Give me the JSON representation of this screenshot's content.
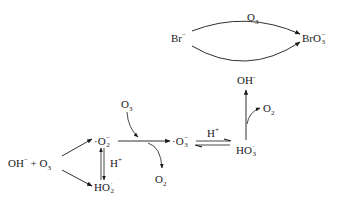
{
  "diagram": {
    "type": "reaction-scheme",
    "nodes": {
      "bromide": {
        "base": "Br",
        "sup": "−"
      },
      "bromate": {
        "base": "BrO",
        "sub": "3",
        "sup": "−"
      },
      "hydroxide_top": {
        "base": "OH",
        "sup": "-"
      },
      "hydroxide_ozone": {
        "base": "OH",
        "sup": "−",
        "plus": "+",
        "o3_base": "O",
        "o3_sub": "3"
      },
      "superoxide": {
        "dot": "·",
        "base": "O",
        "sub": "2",
        "sup": "−"
      },
      "hydroperoxide": {
        "base": "HO",
        "sub": "2",
        "sup": "·"
      },
      "ozonide": {
        "dot": "·",
        "base": "O",
        "sub": "3",
        "sup": "−"
      },
      "hydrotrioxide": {
        "base": "HO",
        "sub": "3",
        "sup": "·"
      }
    },
    "edge_labels": {
      "top_arc": {
        "base": "O",
        "sub": "3"
      },
      "bottom_arc": {
        "base": "OH",
        "sup": "-"
      },
      "o3_in": {
        "base": "O",
        "sub": "3"
      },
      "o2_out": {
        "base": "O",
        "sub": "2"
      },
      "o2_from_ho3": {
        "base": "O",
        "sub": "2"
      },
      "h_plus_vertical": {
        "base": "H",
        "sup": "+"
      },
      "h_plus_equilibrium": {
        "base": "H",
        "sup": "+"
      }
    },
    "colors": {
      "ink": "#1a1a1a",
      "background": "#ffffff"
    }
  }
}
